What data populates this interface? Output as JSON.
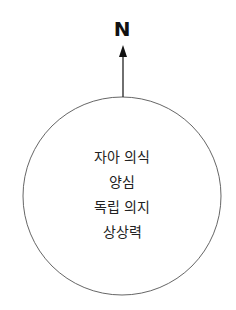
{
  "compass": {
    "label": "N"
  },
  "circle": {
    "lines": [
      "자아 의식",
      "양심",
      "독립 의지",
      "상상력"
    ]
  },
  "colors": {
    "stroke": "#555555",
    "arrow": "#111111",
    "text": "#222222"
  }
}
